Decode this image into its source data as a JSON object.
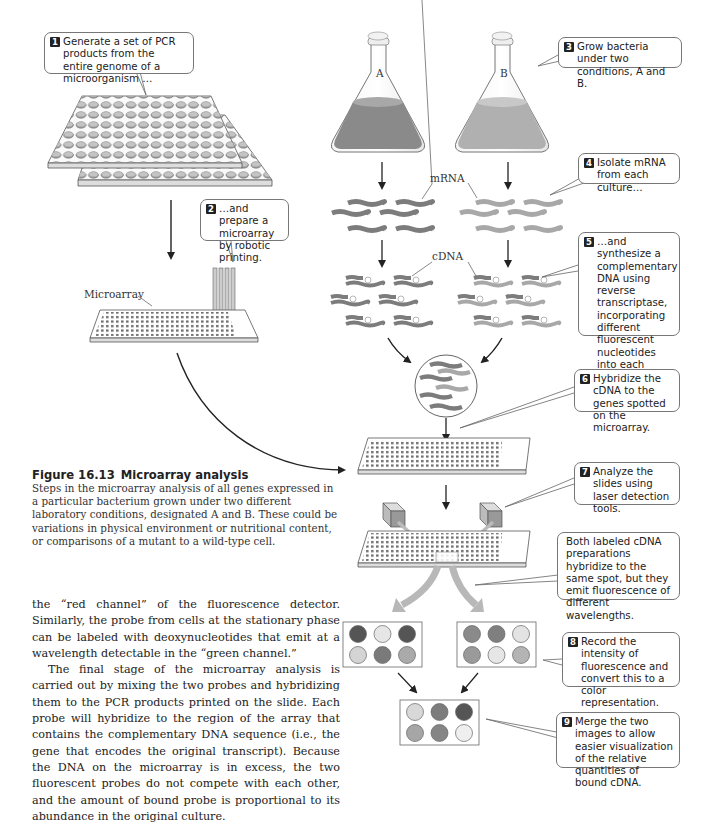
{
  "figure": {
    "number": "Figure 16.13",
    "title": "Microarray analysis",
    "caption": "Steps in the microarray analysis of all genes expressed in a particular bacterium grown under two different laboratory conditions, designated A and B. These could be variations in physical environment or nutritional content, or comparisons of a mutant to a wild-type cell."
  },
  "labels": {
    "flask_a": "A",
    "flask_b": "B",
    "mrna": "mRNA",
    "cdna": "cDNA",
    "microarray": "Microarray"
  },
  "steps": [
    {
      "num": "1",
      "text": "Generate a set of PCR products from the entire genome of a microorganism …"
    },
    {
      "num": "2",
      "text": "…and prepare a microarray by robotic printing."
    },
    {
      "num": "3",
      "text": "Grow bacteria under two conditions, A and B."
    },
    {
      "num": "4",
      "text": "Isolate mRNA from each culture…"
    },
    {
      "num": "5",
      "text": "…and synthesize a complementary DNA using reverse transcriptase, incorporating different fluorescent nucleotides into each cDNA."
    },
    {
      "num": "6",
      "text": "Hybridize the cDNA to the genes spotted on the microarray."
    },
    {
      "num": "7",
      "text": "Analyze the slides using laser detection tools."
    },
    {
      "num": "",
      "text": "Both labeled cDNA preparations hybridize to the same spot, but they emit fluorescence of different wavelengths."
    },
    {
      "num": "8",
      "text": "Record the intensity of fluorescence and convert this to a color representation."
    },
    {
      "num": "9",
      "text": "Merge the two images to allow easier visualization of the relative quantities of bound cDNA."
    }
  ],
  "spot_panels": {
    "left": [
      "#555555",
      "#e6e6e6",
      "#555555",
      "#d4d4d4",
      "#7a7a7a",
      "#aaaaaa"
    ],
    "right": [
      "#8a8a8a",
      "#7f7f7f",
      "#e3e3e3",
      "#9a9a9a",
      "#e6e6e6",
      "#b4b4b4"
    ],
    "merged": [
      "#d8d8d8",
      "#7c7c7c",
      "#555555",
      "#a6a6a6",
      "#858585",
      "#efefef"
    ]
  },
  "colors": {
    "culture_a": "#8a8a8a",
    "culture_b": "#b0b0b0",
    "strand_a": "#7c7c7c",
    "strand_b": "#a8a8a8"
  },
  "body_text": {
    "p1": "the “red channel” of the fluorescence detector. Similarly, the probe from cells at the stationary phase can be labeled with deoxynucleotides that emit at a wavelength detectable in the “green channel.”",
    "p2": "The final stage of the microarray analysis is carried out by mixing the two probes and hybridizing them to the PCR products printed on the slide. Each probe will hybridize to the region of the array that contains the complementary DNA sequence (i.e., the gene that encodes the original transcript). Because the DNA on the microarray is in excess, the two fluorescent probes do not compete with each other, and the amount of bound probe is proportional to its abundance in the original culture."
  }
}
